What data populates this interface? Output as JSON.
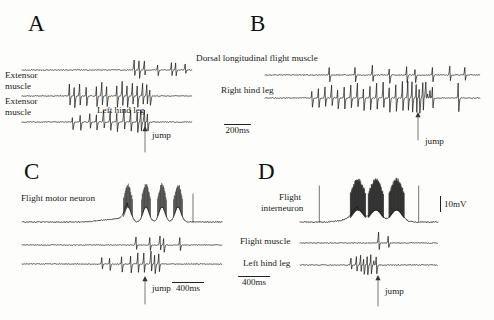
{
  "figure": {
    "width": 494,
    "height": 320,
    "background": "#fdfdfc",
    "ink_color": "#1a1a1a"
  },
  "panels": [
    {
      "id": "A",
      "letter": "A",
      "letter_pos": {
        "x": 28,
        "y": 12
      },
      "time_scale": "200ms",
      "jump_label": "jump",
      "traces": [
        {
          "name": "dorsal-longitudinal-flight-muscle",
          "label": "Dorsal longitudinal flight muscle",
          "label_pos": {
            "x": 196,
            "y": 58
          },
          "baseline_y": 70,
          "x0": 22,
          "x1": 192,
          "spike_times": [
            0.66,
            0.69,
            0.72,
            0.8,
            0.88,
            0.905,
            0.96
          ],
          "spike_amps": [
            10,
            11,
            9,
            7,
            8,
            8,
            6
          ]
        },
        {
          "name": "extensor-muscle-upper",
          "label": "Extensor\nmuscle",
          "label_pos": {
            "x": 5,
            "y": 72
          },
          "baseline_y": 96,
          "x0": 22,
          "x1": 192,
          "spike_times": [
            0.28,
            0.31,
            0.34,
            0.38,
            0.44,
            0.47,
            0.5,
            0.56,
            0.59,
            0.62,
            0.65,
            0.68,
            0.71,
            0.735,
            0.755
          ],
          "spike_amps": [
            13,
            14,
            13,
            12,
            13,
            14,
            13,
            14,
            15,
            14,
            13,
            14,
            13,
            12,
            11
          ]
        },
        {
          "name": "extensor-muscle-lower",
          "label": "Extensor\nmuscle",
          "label_pos": {
            "x": 5,
            "y": 98
          },
          "baseline_y": 122,
          "x0": 22,
          "x1": 192,
          "spike_times": [
            0.3,
            0.345,
            0.4,
            0.44,
            0.48,
            0.52,
            0.56,
            0.6,
            0.64,
            0.68,
            0.7,
            0.72,
            0.74
          ],
          "spike_amps": [
            9,
            10,
            9,
            10,
            11,
            12,
            12,
            13,
            13,
            13,
            13,
            12,
            11
          ]
        }
      ],
      "secondary_label": {
        "text": "Left hind leg",
        "x": 97,
        "y": 110
      },
      "jump_arrow": {
        "x": 145,
        "y_top": 126,
        "y_bottom": 152
      },
      "jump_text_pos": {
        "x": 152,
        "y": 133
      }
    },
    {
      "id": "B",
      "letter": "B",
      "letter_pos": {
        "x": 250,
        "y": 12
      },
      "time_scale": "200ms",
      "scalebar_pos": {
        "x": 224,
        "y": 124,
        "width": 27
      },
      "jump_label": "jump",
      "traces": [
        {
          "name": "dorsal-longitudinal-flight-muscle",
          "label": "Dorsal longitudinal flight muscle",
          "label_pos": {
            "x": 196,
            "y": 58
          },
          "baseline_y": 75,
          "x0": 265,
          "x1": 480,
          "spike_times": [
            0.3,
            0.42,
            0.5,
            0.58,
            0.66,
            0.7,
            0.78,
            0.86,
            0.93
          ],
          "spike_amps": [
            9,
            9,
            10,
            10,
            10,
            9,
            9,
            9,
            8
          ]
        },
        {
          "name": "right-hind-leg",
          "label": "Right hind leg",
          "label_pos": {
            "x": 222,
            "y": 88
          },
          "baseline_y": 98,
          "x0": 265,
          "x1": 480,
          "spike_times": [
            0.22,
            0.25,
            0.28,
            0.31,
            0.34,
            0.37,
            0.4,
            0.43,
            0.46,
            0.49,
            0.52,
            0.55,
            0.58,
            0.61,
            0.64,
            0.665,
            0.685,
            0.705,
            0.72,
            0.735,
            0.748,
            0.76,
            0.77,
            0.78,
            0.9
          ],
          "spike_amps": [
            11,
            12,
            12,
            13,
            13,
            14,
            14,
            15,
            15,
            15,
            16,
            16,
            17,
            17,
            18,
            18,
            19,
            18,
            18,
            17,
            16,
            15,
            14,
            13,
            18
          ]
        }
      ],
      "jump_arrow": {
        "x": 418,
        "y_top": 112,
        "y_bottom": 140
      },
      "jump_text_pos": {
        "x": 425,
        "y": 138
      }
    },
    {
      "id": "C",
      "letter": "C",
      "letter_pos": {
        "x": 24,
        "y": 160
      },
      "time_scale": "400ms",
      "scalebar_pos": {
        "x": 172,
        "y": 282,
        "width": 32
      },
      "jump_label": "jump",
      "traces": [
        {
          "name": "flight-motor-neuron",
          "label": "Flight motor neuron",
          "label_pos": {
            "x": 22,
            "y": 197
          },
          "baseline_y": 222,
          "x0": 22,
          "x1": 222,
          "bursts": [
            0.53,
            0.62,
            0.7,
            0.78
          ],
          "note": "intracellular membrane potential with spike bursts"
        },
        {
          "name": "flight-muscle-trace",
          "label": "",
          "label_pos": {
            "x": 0,
            "y": 0
          },
          "baseline_y": 245,
          "x0": 22,
          "x1": 222,
          "spike_times": [
            0.57,
            0.64,
            0.69,
            0.71,
            0.79
          ],
          "spike_amps": [
            8,
            8,
            9,
            9,
            8
          ]
        },
        {
          "name": "left-hind-leg-trace",
          "label": "",
          "label_pos": {
            "x": 0,
            "y": 0
          },
          "baseline_y": 264,
          "x0": 22,
          "x1": 222,
          "spike_times": [
            0.4,
            0.44,
            0.5,
            0.545,
            0.58,
            0.61,
            0.645,
            0.665,
            0.685
          ],
          "spike_amps": [
            7,
            8,
            10,
            11,
            12,
            12,
            13,
            12,
            11
          ]
        }
      ],
      "jump_arrow": {
        "x": 145,
        "y_top": 276,
        "y_bottom": 304
      },
      "jump_text_pos": {
        "x": 152,
        "y": 285
      }
    },
    {
      "id": "D",
      "letter": "D",
      "letter_pos": {
        "x": 258,
        "y": 160
      },
      "time_scale": "400ms",
      "scalebar_pos": {
        "x": 238,
        "y": 276,
        "width": 32
      },
      "voltage_scale": "10mV",
      "voltage_scale_pos": {
        "x": 440,
        "y": 196
      },
      "jump_label": "jump",
      "traces": [
        {
          "name": "flight-interneuron",
          "label": "Flight\ninterneuron",
          "label_pos": {
            "x": 258,
            "y": 195
          },
          "baseline_y": 222,
          "x0": 300,
          "x1": 438,
          "bursts": [
            0.42,
            0.55,
            0.7
          ],
          "note": "intracellular interneuron recording with dense spiking"
        },
        {
          "name": "flight-muscle",
          "label": "Flight muscle",
          "label_pos": {
            "x": 254,
            "y": 236
          },
          "baseline_y": 243,
          "x0": 300,
          "x1": 438,
          "spike_times": [
            0.57,
            0.64
          ],
          "spike_amps": [
            11,
            7
          ]
        },
        {
          "name": "left-hind-leg",
          "label": "Left hind leg",
          "label_pos": {
            "x": 256,
            "y": 258
          },
          "baseline_y": 265,
          "x0": 300,
          "x1": 438,
          "spike_times": [
            0.37,
            0.41,
            0.44,
            0.465,
            0.49,
            0.515,
            0.54,
            0.555
          ],
          "spike_amps": [
            7,
            9,
            10,
            11,
            12,
            12,
            12,
            11
          ]
        }
      ],
      "jump_arrow": {
        "x": 378,
        "y_top": 275,
        "y_bottom": 306
      },
      "jump_text_pos": {
        "x": 385,
        "y": 288
      }
    }
  ],
  "scale_bars": [
    {
      "id": "scalebar-200ms",
      "label": "200ms"
    },
    {
      "id": "scalebar-400ms-c",
      "label": "400ms"
    },
    {
      "id": "scalebar-400ms-d",
      "label": "400ms"
    },
    {
      "id": "scalebar-10mv",
      "label": "10mV"
    }
  ],
  "chart_data": {
    "type": "line",
    "xlabel": "Time",
    "ylabel": "Amplitude",
    "panels": [
      "A",
      "B",
      "C",
      "D"
    ],
    "series": [
      {
        "name": "Dorsal longitudinal flight muscle (A)",
        "panel": "A"
      },
      {
        "name": "Extensor muscle (A, upper)",
        "panel": "A"
      },
      {
        "name": "Extensor muscle (A, lower) / Left hind leg",
        "panel": "A"
      },
      {
        "name": "Dorsal longitudinal flight muscle (B)",
        "panel": "B"
      },
      {
        "name": "Right hind leg (B)",
        "panel": "B"
      },
      {
        "name": "Flight motor neuron (C)",
        "panel": "C"
      },
      {
        "name": "Flight interneuron (D)",
        "panel": "D"
      },
      {
        "name": "Flight muscle (D)",
        "panel": "D"
      },
      {
        "name": "Left hind leg (D)",
        "panel": "D"
      }
    ],
    "annotations": [
      "jump",
      "jump",
      "jump",
      "jump"
    ],
    "scalebars": [
      "200ms",
      "200ms",
      "400ms",
      "400ms",
      "10mV"
    ],
    "grid": false,
    "legend": "none"
  }
}
